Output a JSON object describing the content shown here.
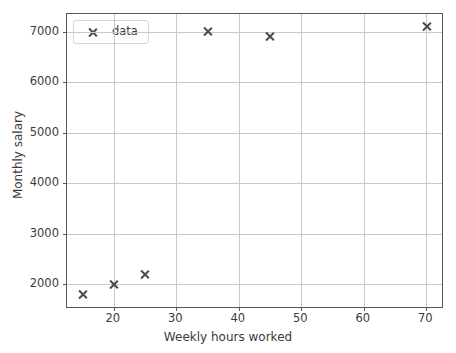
{
  "chart_data": {
    "type": "scatter",
    "title": "",
    "xlabel": "Weekly hours worked",
    "ylabel": "Monthly salary",
    "xlim": [
      12.5,
      72.5
    ],
    "ylim": [
      1550,
      7350
    ],
    "xticks": [
      20,
      30,
      40,
      50,
      60,
      70
    ],
    "xticklabels": [
      "20",
      "30",
      "40",
      "50",
      "60",
      "70"
    ],
    "yticks": [
      2000,
      3000,
      4000,
      5000,
      6000,
      7000
    ],
    "yticklabels": [
      "2000",
      "3000",
      "4000",
      "5000",
      "6000",
      "7000"
    ],
    "grid": true,
    "legend_position": "upper left",
    "marker": "x",
    "marker_color": "#4a4a4a",
    "series": [
      {
        "name": "data",
        "x": [
          15,
          20,
          25,
          35,
          45,
          70
        ],
        "y": [
          1800,
          2000,
          2200,
          7000,
          6900,
          7100
        ]
      }
    ]
  },
  "legend": {
    "entries": [
      {
        "label": "data",
        "marker": "x-marker-icon"
      }
    ]
  },
  "axes": {
    "x_axis_label": "Weekly hours worked",
    "y_axis_label": "Monthly salary"
  }
}
